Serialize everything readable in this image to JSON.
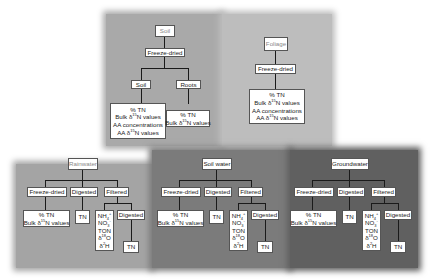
{
  "panels": {
    "soil": {
      "title": "Soil",
      "step": "Freeze-dried",
      "branches": [
        {
          "label": "Soil",
          "outputs": [
            "% TN",
            "Bulk δ15N values",
            "AA concentrations",
            "AA δ15N values"
          ]
        },
        {
          "label": "Roots",
          "outputs": [
            "% TN",
            "Bulk δ15N values"
          ]
        }
      ],
      "color": "#a8a8a8"
    },
    "foliage": {
      "title": "Foliage",
      "step": "Freeze-dried",
      "outputs": [
        "% TN",
        "Bulk δ15N values",
        "AA concentrations",
        "AA δ15N values"
      ],
      "color": "#b8b8b8"
    },
    "rainwater": {
      "title": "Rainwater",
      "steps": [
        "Freeze-dried",
        "Digested",
        "Filtered"
      ],
      "freeze_outputs": [
        "% TN",
        "Bulk δ15N values"
      ],
      "digested_output": "TN",
      "filtered_outputs": [
        "NH4+",
        "NO3-",
        "TON",
        "δ18O",
        "δ2H"
      ],
      "filtered_digested": "Digested",
      "filtered_digested_output": "TN",
      "color": "#a3a3a3"
    },
    "soil_water": {
      "title": "Soil water",
      "steps": [
        "Freeze-dried",
        "Digested",
        "Filtered"
      ],
      "freeze_outputs": [
        "% TN",
        "Bulk δ15N values"
      ],
      "digested_output": "TN",
      "filtered_outputs": [
        "NH4+",
        "NO3-",
        "TON",
        "δ18O",
        "δ2H"
      ],
      "filtered_digested": "Digested",
      "filtered_digested_output": "TN",
      "color": "#7a7a7a"
    },
    "groundwater": {
      "title": "Groundwater",
      "steps": [
        "Freeze-dried",
        "Digested",
        "Filtered"
      ],
      "freeze_outputs": [
        "% TN",
        "Bulk δ15N values"
      ],
      "digested_output": "TN",
      "filtered_outputs": [
        "NH4+",
        "NO3-",
        "TON",
        "δ18O",
        "δ2H"
      ],
      "filtered_digested": "Digested",
      "filtered_digested_output": "TN",
      "color": "#5e5e5e"
    }
  }
}
